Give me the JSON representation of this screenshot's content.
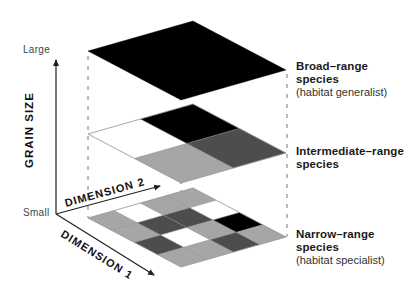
{
  "diagram": {
    "vertical_axis": {
      "title": "GRAIN SIZE",
      "top_label": "Large",
      "bottom_label": "Small"
    },
    "dimension_axes": [
      {
        "label": "DIMENSION 2"
      },
      {
        "label": "DIMENSION 1"
      }
    ],
    "colors": {
      "black": "#000000",
      "dark_gray": "#4d4d4d",
      "light_gray": "#a6a6a6",
      "white": "#ffffff",
      "axis": "#222222",
      "guide": "#555555"
    },
    "layers": [
      {
        "name": "broad-range",
        "grid": 1,
        "cells": [
          [
            "black"
          ]
        ],
        "title": "Broad–range species",
        "title_line1": "Broad–range",
        "title_line2": "species",
        "subtitle": "(habitat generalist)"
      },
      {
        "name": "intermediate-range",
        "grid": 2,
        "cells": [
          [
            "white",
            "light_gray"
          ],
          [
            "black",
            "dark_gray"
          ]
        ],
        "title": "Intermediate–range species",
        "title_line1": "Intermediate–range",
        "title_line2": "species",
        "subtitle": ""
      },
      {
        "name": "narrow-range",
        "grid": 4,
        "cells": [
          [
            "light_gray",
            "light_gray",
            "dark_gray",
            "light_gray"
          ],
          [
            "white",
            "dark_gray",
            "white",
            "light_gray"
          ],
          [
            "light_gray",
            "dark_gray",
            "light_gray",
            "dark_gray"
          ],
          [
            "light_gray",
            "white",
            "black",
            "light_gray"
          ]
        ],
        "title": "Narrow–range species",
        "title_line1": "Narrow–range",
        "title_line2": "species",
        "subtitle": "(habitat specialist)"
      }
    ]
  }
}
